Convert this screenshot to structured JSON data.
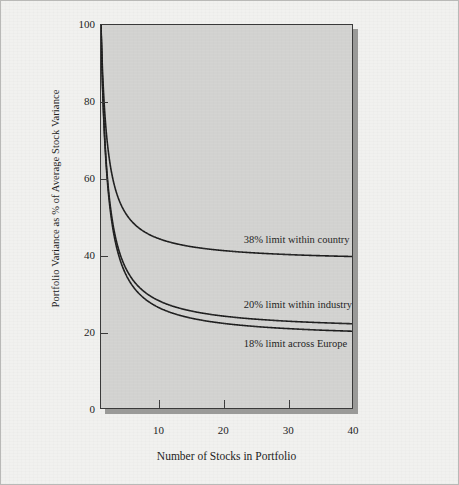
{
  "chart_data": {
    "type": "line",
    "title": "",
    "subtitle": "",
    "xlabel": "Number of Stocks in Portfolio",
    "ylabel": "Portfolio Variance as % of Average Stock Variance",
    "xlim": [
      1,
      40
    ],
    "ylim": [
      0,
      100
    ],
    "grid": false,
    "legend_position": "inline-annotations",
    "xticks": [
      10,
      20,
      30,
      40
    ],
    "yticks": [
      0,
      20,
      40,
      60,
      80,
      100
    ],
    "xticklabels": [
      "10",
      "20",
      "30",
      "40"
    ],
    "yticklabels": [
      "0",
      "20",
      "40",
      "60",
      "80",
      "100"
    ],
    "x": [
      1,
      2,
      3,
      4,
      5,
      6,
      8,
      10,
      12,
      15,
      20,
      25,
      30,
      35,
      40
    ],
    "series": [
      {
        "name": "38% limit within country",
        "limit_percent": 38,
        "color": "#1e1e1e",
        "values": [
          100,
          69.0,
          58.7,
          53.5,
          50.4,
          48.3,
          45.8,
          44.2,
          43.2,
          42.1,
          41.1,
          40.5,
          40.1,
          39.8,
          39.6
        ]
      },
      {
        "name": "20% limit within industry",
        "limit_percent": 20,
        "color": "#1e1e1e",
        "values": [
          100,
          60.0,
          46.7,
          40.0,
          36.0,
          33.3,
          30.0,
          28.0,
          26.7,
          25.3,
          24.0,
          23.2,
          22.7,
          22.3,
          22.0
        ]
      },
      {
        "name": "18% limit across Europe",
        "limit_percent": 18,
        "color": "#1e1e1e",
        "values": [
          100,
          59.0,
          45.3,
          38.5,
          34.4,
          31.7,
          28.2,
          26.2,
          24.8,
          23.5,
          22.1,
          21.3,
          20.7,
          20.3,
          20.0
        ]
      }
    ],
    "annotations": [
      {
        "text": "38% limit within country",
        "x": 23,
        "y": 44
      },
      {
        "text": "20% limit within industry",
        "x": 23,
        "y": 27
      },
      {
        "text": "18% limit across Europe",
        "x": 23,
        "y": 17
      }
    ]
  },
  "axes": {
    "y_title": "Portfolio Variance as % of Average Stock Variance",
    "x_title": "Number of Stocks in Portfolio",
    "y_labels": [
      "100",
      "80",
      "60",
      "40",
      "20",
      "0"
    ],
    "x_labels": [
      "10",
      "20",
      "30",
      "40"
    ]
  },
  "annotations": {
    "country": "38% limit within country",
    "industry": "20% limit within industry",
    "europe": "18% limit across Europe"
  },
  "colors": {
    "page_background": "#f1f1ef",
    "plot_background": "#d2d2d0",
    "plot_border": "#3a3a3a",
    "curve": "#1e1e1e",
    "shadow": "#9a9a98",
    "text": "#1d1d1d"
  }
}
